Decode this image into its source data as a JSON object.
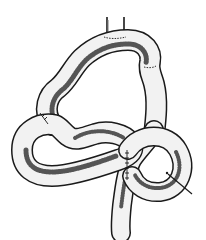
{
  "figure": {
    "style": "pen-and-ink hatched line drawing",
    "colors": {
      "background": "#ffffff",
      "ink": "#1a1a1a",
      "tube_fill": "#f2f2f2",
      "shading": "#555555"
    },
    "features": [
      "vertical stalk at top",
      "upper arched loop",
      "left lower loop",
      "central crossing segment with suture line",
      "right circular loop with suture and needle tip",
      "descending tail at bottom"
    ]
  }
}
